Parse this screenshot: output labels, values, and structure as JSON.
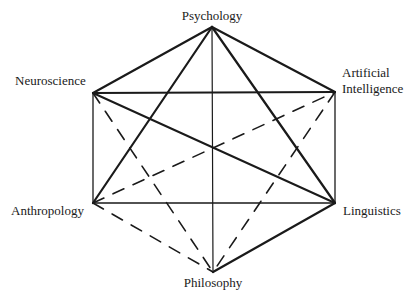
{
  "diagram": {
    "stroke_color": "#1a1a1a",
    "background": "#ffffff",
    "nodes": [
      {
        "id": "psychology",
        "label_lines": [
          "Psychology"
        ],
        "x": 212,
        "y": 27,
        "label_x": 212,
        "label_y": 20,
        "anchor": "middle"
      },
      {
        "id": "neuroscience",
        "label_lines": [
          "Neuroscience"
        ],
        "x": 93,
        "y": 93,
        "label_x": 15,
        "label_y": 85,
        "anchor": "start"
      },
      {
        "id": "artificial-intelligence",
        "label_lines": [
          "Artificial",
          "Intelligence"
        ],
        "x": 335,
        "y": 92,
        "label_x": 342,
        "label_y": 77,
        "anchor": "start"
      },
      {
        "id": "anthropology",
        "label_lines": [
          "Anthropology"
        ],
        "x": 93,
        "y": 203,
        "label_x": 11,
        "label_y": 215,
        "anchor": "start"
      },
      {
        "id": "linguistics",
        "label_lines": [
          "Linguistics"
        ],
        "x": 335,
        "y": 203,
        "label_x": 343,
        "label_y": 215,
        "anchor": "start"
      },
      {
        "id": "philosophy",
        "label_lines": [
          "Philosophy"
        ],
        "x": 213,
        "y": 272,
        "label_x": 213,
        "label_y": 287,
        "anchor": "middle"
      }
    ],
    "edges": [
      {
        "from": "psychology",
        "to": "neuroscience",
        "style": "solid",
        "width": 2.2
      },
      {
        "from": "psychology",
        "to": "artificial-intelligence",
        "style": "solid",
        "width": 2.2
      },
      {
        "from": "psychology",
        "to": "anthropology",
        "style": "solid",
        "width": 2.2
      },
      {
        "from": "psychology",
        "to": "linguistics",
        "style": "solid",
        "width": 2.2
      },
      {
        "from": "psychology",
        "to": "philosophy",
        "style": "solid",
        "width": 1.2
      },
      {
        "from": "neuroscience",
        "to": "artificial-intelligence",
        "style": "solid",
        "width": 1.8
      },
      {
        "from": "neuroscience",
        "to": "anthropology",
        "style": "solid",
        "width": 1.3
      },
      {
        "from": "neuroscience",
        "to": "linguistics",
        "style": "solid",
        "width": 2.0
      },
      {
        "from": "artificial-intelligence",
        "to": "linguistics",
        "style": "solid",
        "width": 1.3
      },
      {
        "from": "anthropology",
        "to": "linguistics",
        "style": "solid",
        "width": 1.6
      },
      {
        "from": "linguistics",
        "to": "philosophy",
        "style": "solid",
        "width": 2.2
      },
      {
        "from": "neuroscience",
        "to": "philosophy",
        "style": "dashed",
        "width": 1.6
      },
      {
        "from": "anthropology",
        "to": "artificial-intelligence",
        "style": "dashed",
        "width": 1.6
      },
      {
        "from": "artificial-intelligence",
        "to": "philosophy",
        "style": "dashed",
        "width": 1.6
      },
      {
        "from": "anthropology",
        "to": "philosophy",
        "style": "dashed",
        "width": 1.6
      }
    ]
  }
}
